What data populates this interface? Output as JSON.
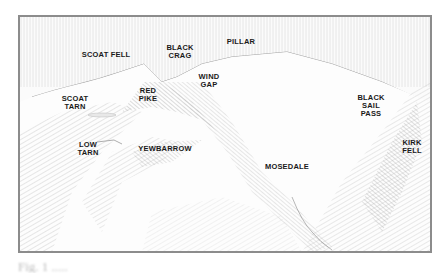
{
  "illustration": {
    "description": "Pencil sketch of fells above Wasdale",
    "labels": [
      {
        "id": "scoat-fell",
        "text": "SCOAT FELL",
        "x": 106,
        "y": 54
      },
      {
        "id": "black-crag",
        "text": "BLACK\nCRAG",
        "x": 179,
        "y": 47
      },
      {
        "id": "pillar",
        "text": "PILLAR",
        "x": 240,
        "y": 40
      },
      {
        "id": "wind-gap",
        "text": "WIND\nGAP",
        "x": 202,
        "y": 75
      },
      {
        "id": "red-pike",
        "text": "RED\nPIKE",
        "x": 141,
        "y": 88
      },
      {
        "id": "scoat-tarn",
        "text": "SCOAT\nTARN",
        "x": 64,
        "y": 96
      },
      {
        "id": "black-sail-pass",
        "text": "BLACK\nSAIL\nPASS",
        "x": 362,
        "y": 95
      },
      {
        "id": "low-tarn",
        "text": "LOW\nTARN",
        "x": 79,
        "y": 141
      },
      {
        "id": "yewbarrow",
        "text": "YEWBARROW",
        "x": 140,
        "y": 145
      },
      {
        "id": "mosedale",
        "text": "MOSEDALE",
        "x": 265,
        "y": 163
      },
      {
        "id": "kirk-fell",
        "text": "KIRK\nFELL",
        "x": 403,
        "y": 139
      }
    ]
  },
  "caption": {
    "text": "Fig. 1  ....."
  }
}
